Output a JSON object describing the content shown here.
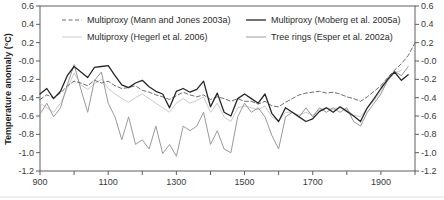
{
  "figure": {
    "background": "#ffffff",
    "frame_color": "#5f5f5f",
    "tick_label_color": "#3a3a3a"
  },
  "chart_data": {
    "type": "line",
    "title": "",
    "xlabel": "",
    "ylabel": "Temperature anomaly (°C)",
    "xlim": [
      900,
      2000
    ],
    "ylim": [
      -1.2,
      0.6
    ],
    "grid": false,
    "legend_position": "top-inside-two-columns",
    "x_major_ticks": [
      900,
      1100,
      1300,
      1500,
      1700,
      1900
    ],
    "x_minor_ticks": [
      1000,
      1200,
      1400,
      1600,
      1800,
      2000
    ],
    "y_ticks": [
      {
        "v": 0.6,
        "label": "0.6"
      },
      {
        "v": 0.4,
        "label": "0.4"
      },
      {
        "v": 0.2,
        "label": "0.2"
      },
      {
        "v": 0.0,
        "label": "-0.0"
      },
      {
        "v": -0.2,
        "label": "-0.2"
      },
      {
        "v": -0.4,
        "label": "-0.4"
      },
      {
        "v": -0.6,
        "label": "-0.6"
      },
      {
        "v": -0.8,
        "label": "-0.8"
      },
      {
        "v": -1.0,
        "label": "-1.0"
      },
      {
        "v": -1.2,
        "label": "-1.2"
      }
    ],
    "draw_order": [
      2,
      3,
      0,
      1
    ],
    "series": [
      {
        "name": "Multiproxy (Mann and Jones 2003a)",
        "style": "dashed",
        "color": "#6e6e6e",
        "width": 1,
        "x_start": 900,
        "x_step": 20,
        "values": [
          -0.42,
          -0.37,
          -0.4,
          -0.35,
          -0.27,
          -0.22,
          -0.24,
          -0.27,
          -0.21,
          -0.24,
          -0.22,
          -0.27,
          -0.3,
          -0.29,
          -0.27,
          -0.32,
          -0.34,
          -0.37,
          -0.39,
          -0.42,
          -0.38,
          -0.34,
          -0.37,
          -0.39,
          -0.37,
          -0.42,
          -0.39,
          -0.41,
          -0.44,
          -0.41,
          -0.44,
          -0.44,
          -0.47,
          -0.44,
          -0.49,
          -0.5,
          -0.45,
          -0.41,
          -0.37,
          -0.35,
          -0.34,
          -0.33,
          -0.35,
          -0.34,
          -0.36,
          -0.39,
          -0.41,
          -0.44,
          -0.39,
          -0.33,
          -0.27,
          -0.18,
          -0.1,
          -0.03,
          0.06,
          0.2
        ]
      },
      {
        "name": "Multiproxy (Moberg et al. 2005a)",
        "style": "solid",
        "color": "#262626",
        "width": 1.3,
        "x_start": 900,
        "x_step": 20,
        "values": [
          -0.36,
          -0.3,
          -0.41,
          -0.33,
          -0.16,
          -0.06,
          -0.12,
          -0.18,
          -0.07,
          -0.06,
          -0.05,
          -0.16,
          -0.26,
          -0.29,
          -0.24,
          -0.21,
          -0.28,
          -0.33,
          -0.36,
          -0.51,
          -0.33,
          -0.3,
          -0.34,
          -0.31,
          -0.22,
          -0.5,
          -0.35,
          -0.56,
          -0.6,
          -0.41,
          -0.36,
          -0.41,
          -0.46,
          -0.36,
          -0.57,
          -0.66,
          -0.51,
          -0.56,
          -0.61,
          -0.66,
          -0.63,
          -0.55,
          -0.51,
          -0.56,
          -0.5,
          -0.55,
          -0.6,
          -0.66,
          -0.51,
          -0.41,
          -0.3,
          -0.2,
          -0.12,
          -0.21,
          -0.15
        ]
      },
      {
        "name": "Multiproxy (Hegerl et al. 2006)",
        "style": "solid",
        "color": "#cbcbcb",
        "width": 1,
        "x_start": 900,
        "x_step": 20,
        "values": [
          -0.46,
          -0.51,
          -0.56,
          -0.46,
          -0.3,
          -0.13,
          -0.26,
          -0.31,
          -0.25,
          -0.2,
          -0.3,
          -0.36,
          -0.41,
          -0.45,
          -0.4,
          -0.36,
          -0.41,
          -0.46,
          -0.51,
          -0.56,
          -0.46,
          -0.41,
          -0.46,
          -0.43,
          -0.39,
          -0.56,
          -0.46,
          -0.61,
          -0.66,
          -0.51,
          -0.49,
          -0.51,
          -0.53,
          -0.49,
          -0.61,
          -0.66,
          -0.56,
          -0.56,
          -0.59,
          -0.56,
          -0.59,
          -0.53,
          -0.51,
          -0.53,
          -0.51,
          -0.53,
          -0.59,
          -0.61,
          -0.51,
          -0.43,
          -0.33,
          -0.22,
          -0.13,
          -0.1
        ]
      },
      {
        "name": "Tree rings (Esper et al. 2002a)",
        "style": "solid",
        "color": "#9a9a9a",
        "width": 1,
        "x_start": 900,
        "x_step": 20,
        "values": [
          -0.58,
          -0.46,
          -0.61,
          -0.51,
          -0.26,
          -0.04,
          -0.31,
          -0.56,
          -0.21,
          -0.12,
          -0.46,
          -0.61,
          -0.86,
          -0.61,
          -0.91,
          -0.86,
          -0.96,
          -0.71,
          -1.01,
          -0.91,
          -1.04,
          -0.71,
          -0.76,
          -0.71,
          -0.56,
          -0.91,
          -0.76,
          -0.96,
          -1.0,
          -0.61,
          -0.46,
          -0.56,
          -0.51,
          -0.61,
          -0.81,
          -0.96,
          -0.61,
          -0.56,
          -0.61,
          -0.51,
          -0.61,
          -0.51,
          -0.56,
          -0.51,
          -0.56,
          -0.51,
          -0.66,
          -0.71,
          -0.56,
          -0.46,
          -0.36,
          -0.21,
          -0.11,
          -0.16,
          -0.06
        ]
      }
    ]
  }
}
